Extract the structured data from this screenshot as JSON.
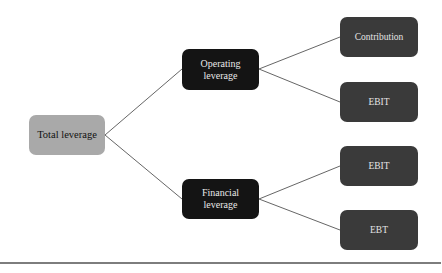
{
  "diagram": {
    "root": {
      "label": "Total leverage",
      "color": "#a9a9a9"
    },
    "branches": [
      {
        "label_line1": "Operating",
        "label_line2": "leverage",
        "color": "#141414",
        "children": [
          {
            "label": "Contribution"
          },
          {
            "label": "EBIT"
          }
        ]
      },
      {
        "label_line1": "Financial",
        "label_line2": "leverage",
        "color": "#141414",
        "children": [
          {
            "label": "EBIT"
          },
          {
            "label": "EBT"
          }
        ]
      }
    ],
    "leaf_color": "#3a3a3a",
    "connector_color": "#666666"
  }
}
